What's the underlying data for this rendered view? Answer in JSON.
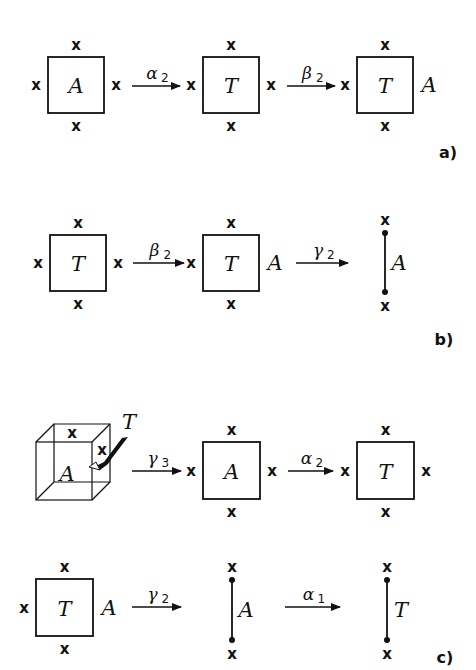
{
  "figure": {
    "mark_symbol": "x",
    "panels": [
      {
        "id": "a",
        "label": "a)",
        "steps": [
          {
            "kind": "square",
            "inside": "A",
            "left": "x",
            "right": "x",
            "top": "x",
            "bottom": "x"
          },
          {
            "kind": "arrow",
            "op": "α",
            "sub": "2"
          },
          {
            "kind": "square",
            "inside": "T",
            "left": "x",
            "right": "x",
            "top": "x",
            "bottom": "x"
          },
          {
            "kind": "arrow",
            "op": "β",
            "sub": "2"
          },
          {
            "kind": "square",
            "inside": "T",
            "left": "x",
            "right": "A",
            "top": "x",
            "bottom": "x"
          }
        ]
      },
      {
        "id": "b",
        "label": "b)",
        "steps": [
          {
            "kind": "square",
            "inside": "T",
            "left": "x",
            "right": "x",
            "top": "x",
            "bottom": "x"
          },
          {
            "kind": "arrow",
            "op": "β",
            "sub": "2"
          },
          {
            "kind": "square",
            "inside": "T",
            "left": "x",
            "right": "A",
            "top": "x",
            "bottom": "x"
          },
          {
            "kind": "arrow",
            "op": "γ",
            "sub": "2"
          },
          {
            "kind": "segment",
            "label": "A",
            "top": "x",
            "bottom": "x"
          }
        ]
      },
      {
        "id": "c",
        "label": "c)",
        "row1": [
          {
            "kind": "cube",
            "inside": "A",
            "top": "x",
            "right": "x",
            "pointer": "T"
          },
          {
            "kind": "arrow",
            "op": "γ",
            "sub": "3"
          },
          {
            "kind": "square",
            "inside": "A",
            "left": "x",
            "right": "x",
            "top": "x",
            "bottom": "x"
          },
          {
            "kind": "arrow",
            "op": "α",
            "sub": "2"
          },
          {
            "kind": "square",
            "inside": "T",
            "left": "x",
            "right": "x",
            "top": "x",
            "bottom": "x"
          }
        ],
        "row2": [
          {
            "kind": "square",
            "inside": "T",
            "left": "x",
            "right": "A",
            "top": "x",
            "bottom": "x"
          },
          {
            "kind": "arrow",
            "op": "γ",
            "sub": "2"
          },
          {
            "kind": "segment",
            "label": "A",
            "top": "x",
            "bottom": "x"
          },
          {
            "kind": "arrow",
            "op": "α",
            "sub": "1"
          },
          {
            "kind": "segment",
            "label": "T",
            "top": "x",
            "bottom": "x"
          }
        ]
      }
    ]
  }
}
